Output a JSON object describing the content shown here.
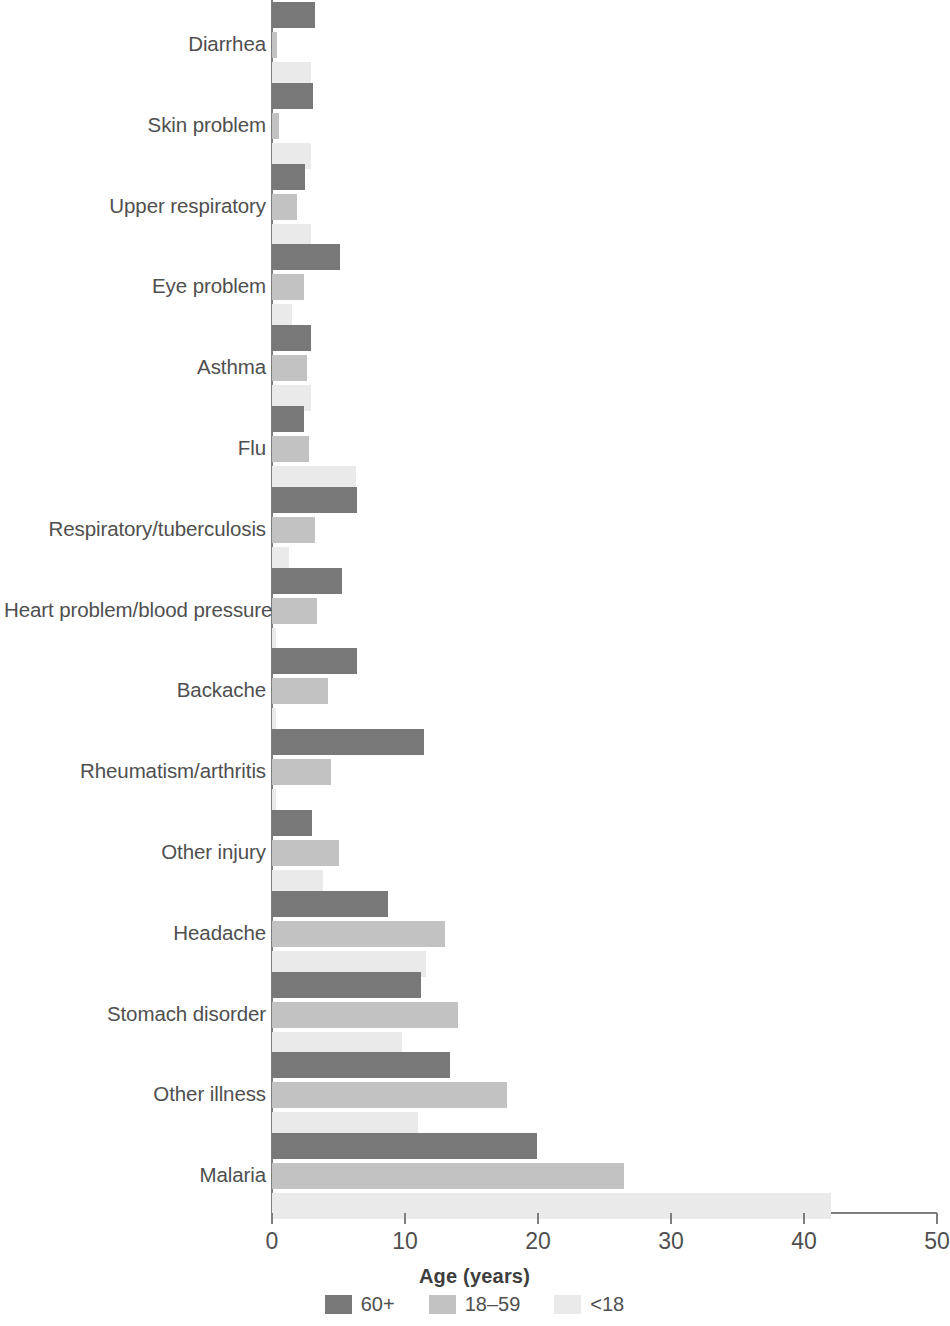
{
  "chart_data": {
    "type": "bar",
    "orientation": "horizontal",
    "title": "",
    "xlabel": "Age (years)",
    "ylabel": "",
    "xlim": [
      0,
      50
    ],
    "xticks": [
      0,
      10,
      20,
      30,
      40,
      50
    ],
    "grid": false,
    "legend_position": "bottom",
    "categories": [
      "Diarrhea",
      "Skin problem",
      "Upper respiratory",
      "Eye problem",
      "Asthma",
      "Flu",
      "Respiratory/tuberculosis",
      "Heart problem/blood pressure",
      "Backache",
      "Rheumatism/arthritis",
      "Other injury",
      "Headache",
      "Stomach disorder",
      "Other illness",
      "Malaria"
    ],
    "series": [
      {
        "name": "60+",
        "color": "#787878",
        "values": [
          3.2,
          3.1,
          2.5,
          5.1,
          2.9,
          2.4,
          6.4,
          5.3,
          6.4,
          11.4,
          3.0,
          8.7,
          11.2,
          13.4,
          19.9
        ]
      },
      {
        "name": "18–59",
        "color": "#c2c2c2",
        "values": [
          0.4,
          0.5,
          1.9,
          2.4,
          2.6,
          2.8,
          3.2,
          3.4,
          4.2,
          4.4,
          5.0,
          13.0,
          14.0,
          17.7,
          26.5
        ]
      },
      {
        "name": "<18",
        "color": "#eaeaea",
        "values": [
          2.9,
          2.9,
          2.9,
          1.5,
          2.9,
          6.3,
          1.3,
          0.3,
          0.3,
          0.3,
          3.8,
          11.6,
          9.8,
          11.0,
          42.0
        ]
      }
    ]
  },
  "legend": {
    "items": [
      {
        "label": "60+",
        "color": "#787878"
      },
      {
        "label": "18–59",
        "color": "#c2c2c2"
      },
      {
        "label": "<18",
        "color": "#eaeaea"
      }
    ]
  },
  "axis": {
    "x_title": "Age (years)",
    "tick_labels": [
      "0",
      "10",
      "20",
      "30",
      "40",
      "50"
    ]
  }
}
